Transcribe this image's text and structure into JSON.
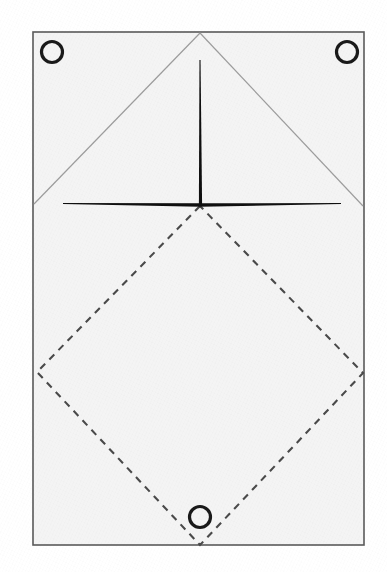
{
  "figure": {
    "canvas": {
      "width": 387,
      "height": 572
    },
    "background_color": "#ffffff"
  },
  "sheet": {
    "name": "sheet-outline",
    "x": 33,
    "y": 32,
    "width": 331,
    "height": 513,
    "fill_color": "#f4f4f4",
    "stroke_color": "#5a5a5a",
    "stroke_width": 1.6
  },
  "circles": [
    {
      "label": "top-left-grommet",
      "cx": 52,
      "cy": 52,
      "r": 10.5,
      "stroke_color": "#1a1a1a",
      "stroke_width": 3.2
    },
    {
      "label": "top-right-grommet",
      "cx": 347,
      "cy": 52,
      "r": 10.5,
      "stroke_color": "#1a1a1a",
      "stroke_width": 3.2
    },
    {
      "label": "bottom-center-grommet",
      "cx": 200,
      "cy": 517,
      "r": 10.5,
      "stroke_color": "#1a1a1a",
      "stroke_width": 3.2
    }
  ],
  "triangle": {
    "label": "grey-fold-triangle",
    "apex": {
      "x": 200,
      "y": 33
    },
    "left_foot": {
      "x": 34,
      "y": 204
    },
    "right_foot": {
      "x": 363,
      "y": 206
    },
    "stroke_color": "#9d9d9d",
    "stroke_width": 1.2
  },
  "mast": {
    "label": "vertical-mast-spike",
    "top": {
      "x": 200,
      "y": 60
    },
    "bottom": {
      "x": 200.5,
      "y": 205
    },
    "top_width": 1.1,
    "bottom_width": 3.2,
    "fill_color": "#101010"
  },
  "spreader": {
    "label": "horizontal-spreader-beam",
    "left": {
      "x": 63,
      "y": 203.5
    },
    "right": {
      "x": 341,
      "y": 203.5
    },
    "center": {
      "x": 200,
      "y": 205
    },
    "center_thickness": 3.4,
    "tip_thickness": 1.0,
    "fill_color": "#101010"
  },
  "diamond": {
    "label": "dashed-diamond",
    "top_vertex": {
      "x": 200,
      "y": 206
    },
    "left_vertex": {
      "x": 37,
      "y": 372
    },
    "right_vertex": {
      "x": 363,
      "y": 373
    },
    "bottom_vertex": {
      "x": 200,
      "y": 545
    },
    "stroke_color": "#4a4a4a",
    "stroke_width": 2.1,
    "dash_length": 7,
    "dash_gap": 6
  },
  "chart_data": {
    "type": "scatter",
    "xlabel": "",
    "ylabel": "",
    "xlim": [
      0,
      387
    ],
    "ylim": [
      572,
      0
    ],
    "grid": false,
    "legend": "none",
    "annotations": [
      "sheet rectangle 33,32 to 364,545",
      "triangle apex 200,33 feet 34,204 and 363,206",
      "mast 200,60 to 200,205",
      "spreader 63,204 to 341,204",
      "dashed diamond vertices 200,206 / 37,372 / 363,373 / 200,545",
      "circles at 52,52 and 347,52 and 200,517 radius 10.5"
    ]
  }
}
